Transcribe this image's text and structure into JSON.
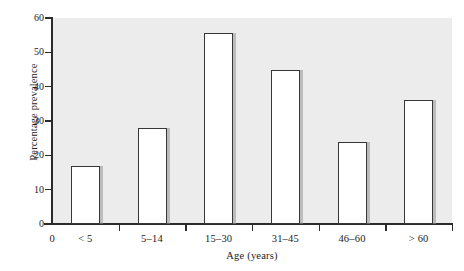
{
  "chart_data": {
    "type": "bar",
    "title": "",
    "subtitle": "",
    "xlabel": "Age (years)",
    "ylabel": "Percentage prevalence",
    "categories": [
      "< 5",
      "5–14",
      "15–30",
      "31–45",
      "46–60",
      "> 60"
    ],
    "values": [
      17,
      28,
      55.5,
      45,
      24,
      36
    ],
    "series": [
      {
        "name": "Percentage prevalence",
        "values": [
          17,
          28,
          55.5,
          45,
          24,
          36
        ]
      }
    ],
    "ylim": [
      0,
      60
    ],
    "xlim_origin_label": "0",
    "y_ticks": [
      0,
      10,
      20,
      30,
      40,
      50,
      60
    ],
    "y_tick_labels": [
      "0",
      "10",
      "20",
      "30",
      "40",
      "50",
      "60"
    ],
    "grid": false,
    "legend": false,
    "legend_position": "none",
    "bar_fill_color": "#ffffff",
    "bar_edge_color": "#373737",
    "bar_shadow_color": "#969696",
    "plot_background_color": "#ececec",
    "axis_color": "#2b2b2b",
    "figure_background_color": "#ffffff"
  }
}
